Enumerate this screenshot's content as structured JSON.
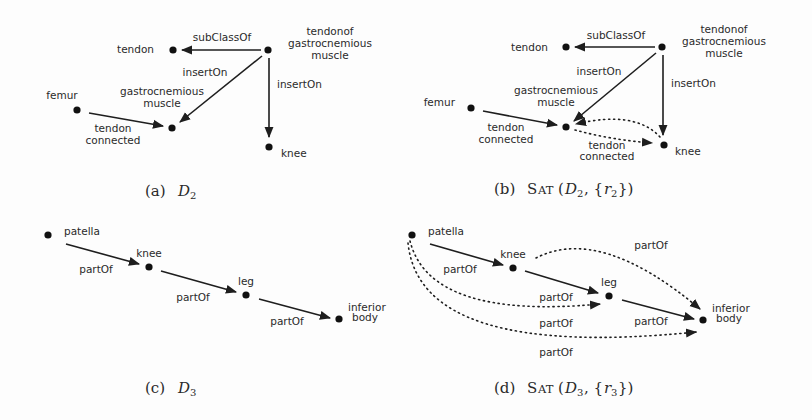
{
  "figure": {
    "panels": [
      {
        "id": "a",
        "caption_prefix": "(a)",
        "caption_math": "D",
        "caption_sub": "2",
        "nodes": [
          {
            "id": "tendon",
            "label": [
              "tendon"
            ]
          },
          {
            "id": "tendonof",
            "label": [
              "tendonof",
              "gastrocnemious",
              "muscle"
            ]
          },
          {
            "id": "femur",
            "label": [
              "femur"
            ]
          },
          {
            "id": "gastroc",
            "label": [
              "gastrocnemious",
              "muscle"
            ]
          },
          {
            "id": "knee",
            "label": [
              "knee"
            ]
          }
        ],
        "edges": [
          {
            "from": "tendonof",
            "to": "tendon",
            "label": [
              "subClassOf"
            ],
            "style": "solid"
          },
          {
            "from": "tendonof",
            "to": "gastroc",
            "label": [
              "insertOn"
            ],
            "style": "solid"
          },
          {
            "from": "tendonof",
            "to": "knee",
            "label": [
              "insertOn"
            ],
            "style": "solid"
          },
          {
            "from": "femur",
            "to": "gastroc",
            "label": [
              "tendon",
              "connected"
            ],
            "style": "solid"
          }
        ]
      },
      {
        "id": "b",
        "caption_prefix": "(b)",
        "caption_func": "Sat",
        "caption_math": "D",
        "caption_sub": "2",
        "caption_rule": "r",
        "caption_rule_sub": "2",
        "nodes": [
          {
            "id": "tendon",
            "label": [
              "tendon"
            ]
          },
          {
            "id": "tendonof",
            "label": [
              "tendonof",
              "gastrocnemious",
              "muscle"
            ]
          },
          {
            "id": "femur",
            "label": [
              "femur"
            ]
          },
          {
            "id": "gastroc",
            "label": [
              "gastrocnemious",
              "muscle"
            ]
          },
          {
            "id": "knee",
            "label": [
              "knee"
            ]
          }
        ],
        "edges": [
          {
            "from": "tendonof",
            "to": "tendon",
            "label": [
              "subClassOf"
            ],
            "style": "solid"
          },
          {
            "from": "tendonof",
            "to": "gastroc",
            "label": [
              "insertOn"
            ],
            "style": "solid"
          },
          {
            "from": "tendonof",
            "to": "knee",
            "label": [
              "insertOn"
            ],
            "style": "solid"
          },
          {
            "from": "femur",
            "to": "gastroc",
            "label": [
              "tendon",
              "connected"
            ],
            "style": "solid"
          },
          {
            "from": "gastroc",
            "to": "knee",
            "label": [
              "tendon",
              "connected"
            ],
            "style": "dotted"
          },
          {
            "from": "knee",
            "to": "gastroc",
            "label": [],
            "style": "dotted"
          }
        ]
      },
      {
        "id": "c",
        "caption_prefix": "(c)",
        "caption_math": "D",
        "caption_sub": "3",
        "nodes": [
          {
            "id": "patella",
            "label": [
              "patella"
            ]
          },
          {
            "id": "knee",
            "label": [
              "knee"
            ]
          },
          {
            "id": "leg",
            "label": [
              "leg"
            ]
          },
          {
            "id": "inferior_body",
            "label": [
              "inferior",
              "body"
            ]
          }
        ],
        "edges": [
          {
            "from": "patella",
            "to": "knee",
            "label": [
              "partOf"
            ],
            "style": "solid"
          },
          {
            "from": "knee",
            "to": "leg",
            "label": [
              "partOf"
            ],
            "style": "solid"
          },
          {
            "from": "leg",
            "to": "inferior_body",
            "label": [
              "partOf"
            ],
            "style": "solid"
          }
        ]
      },
      {
        "id": "d",
        "caption_prefix": "(d)",
        "caption_func": "Sat",
        "caption_math": "D",
        "caption_sub": "3",
        "caption_rule": "r",
        "caption_rule_sub": "3",
        "nodes": [
          {
            "id": "patella",
            "label": [
              "patella"
            ]
          },
          {
            "id": "knee",
            "label": [
              "knee"
            ]
          },
          {
            "id": "leg",
            "label": [
              "leg"
            ]
          },
          {
            "id": "inferior_body",
            "label": [
              "inferior",
              "body"
            ]
          }
        ],
        "edges": [
          {
            "from": "patella",
            "to": "knee",
            "label": [
              "partOf"
            ],
            "style": "solid"
          },
          {
            "from": "knee",
            "to": "leg",
            "label": [
              "partOf"
            ],
            "style": "solid"
          },
          {
            "from": "leg",
            "to": "inferior_body",
            "label": [
              "partOf"
            ],
            "style": "solid"
          },
          {
            "from": "knee",
            "to": "inferior_body",
            "label": [
              "partOf"
            ],
            "style": "dotted"
          },
          {
            "from": "patella",
            "to": "leg",
            "label": [
              "partOf"
            ],
            "style": "dotted"
          },
          {
            "from": "patella",
            "to": "inferior_body",
            "label": [
              "partOf"
            ],
            "style": "dotted"
          }
        ]
      }
    ]
  }
}
